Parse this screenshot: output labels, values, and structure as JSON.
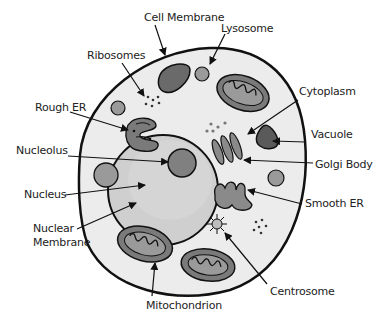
{
  "diagram": {
    "colors": {
      "background": "#ffffff",
      "cytoplasm": "#ececec",
      "outline": "#111111",
      "nucleus": "#cfcfcf",
      "organelle_dark": "#6a6a6a",
      "organelle_mid": "#9a9a9a",
      "label_text": "#222222"
    },
    "labels": {
      "cell_membrane": "Cell Membrane",
      "lysosome": "Lysosome",
      "ribosomes": "Ribosomes",
      "rough_er": "Rough ER",
      "cytoplasm": "Cytoplasm",
      "vacuole": "Vacuole",
      "nucleolus": "Nucleolus",
      "golgi_body": "Golgi Body",
      "nucleus": "Nucleus",
      "smooth_er": "Smooth ER",
      "nuclear_membrane_line1": "Nuclear",
      "nuclear_membrane_line2": "Membrane",
      "centrosome": "Centrosome",
      "mitochondrion": "Mitochondrion"
    }
  }
}
